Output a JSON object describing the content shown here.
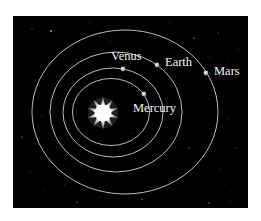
{
  "diagram": {
    "background": "#000000",
    "orbit_color": "#cfcfcf",
    "sun": {
      "cx": 103,
      "cy": 113,
      "r_outer": 17,
      "r_inner": 7,
      "points": 10
    },
    "planets": [
      {
        "name": "Mercury",
        "label": "Mercury",
        "orbit": {
          "cx": 111,
          "cy": 112,
          "rx": 38.5,
          "ry": 33.5
        },
        "pos": [
          144,
          94
        ],
        "label_pos": [
          133,
          112
        ]
      },
      {
        "name": "Venus",
        "label": "Venus",
        "orbit": {
          "cx": 113,
          "cy": 112.5,
          "rx": 50,
          "ry": 44.5
        },
        "pos": [
          123,
          69
        ],
        "label_pos": [
          111,
          60
        ]
      },
      {
        "name": "Earth",
        "label": "Earth",
        "orbit": {
          "cx": 116,
          "cy": 112,
          "rx": 66,
          "ry": 60
        },
        "pos": [
          157,
          65
        ],
        "label_pos": [
          165,
          66
        ]
      },
      {
        "name": "Mars",
        "label": "Mars",
        "orbit": {
          "cx": 125,
          "cy": 112,
          "rx": 93,
          "ry": 82
        },
        "pos": [
          206,
          73
        ],
        "label_pos": [
          214,
          75
        ]
      }
    ]
  }
}
